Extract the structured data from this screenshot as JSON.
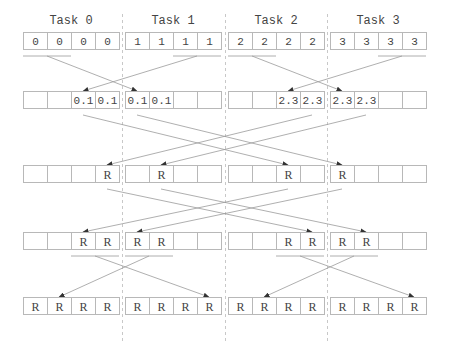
{
  "tasks": [
    "Task 0",
    "Task 1",
    "Task 2",
    "Task 3"
  ],
  "rows": [
    [
      [
        "0",
        "0",
        "0",
        "0"
      ],
      [
        "1",
        "1",
        "1",
        "1"
      ],
      [
        "2",
        "2",
        "2",
        "2"
      ],
      [
        "3",
        "3",
        "3",
        "3"
      ]
    ],
    [
      [
        "",
        "",
        "0.1",
        "0.1"
      ],
      [
        "0.1",
        "0.1",
        "",
        ""
      ],
      [
        "",
        "",
        "2.3",
        "2.3"
      ],
      [
        "2.3",
        "2.3",
        "",
        ""
      ]
    ],
    [
      [
        "",
        "",
        "",
        "R"
      ],
      [
        "",
        "R",
        "",
        ""
      ],
      [
        "",
        "",
        "R",
        ""
      ],
      [
        "R",
        "",
        "",
        ""
      ]
    ],
    [
      [
        "",
        "",
        "R",
        "R"
      ],
      [
        "R",
        "R",
        "",
        ""
      ],
      [
        "",
        "",
        "R",
        "R"
      ],
      [
        "R",
        "R",
        "",
        ""
      ]
    ],
    [
      [
        "R",
        "R",
        "R",
        "R"
      ],
      [
        "R",
        "R",
        "R",
        "R"
      ],
      [
        "R",
        "R",
        "R",
        "R"
      ],
      [
        "R",
        "R",
        "R",
        "R"
      ]
    ]
  ],
  "colors": {
    "line": "#9a9a9a",
    "cell_border": "#b8b8b8",
    "text": "#444444",
    "separator": "#c8c8c8"
  }
}
